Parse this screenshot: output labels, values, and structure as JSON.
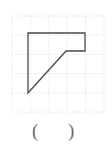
{
  "figure": {
    "title": "",
    "grid": {
      "columns": 5,
      "rows": 5,
      "cell_size": 18.4,
      "origin_x": 12,
      "origin_y": 16,
      "line_color": "#dcdcdc",
      "style": "dotted"
    },
    "shape": {
      "name": "right-trapezoid-polygon",
      "stroke_color": "#4a4a4a",
      "stroke_width": 1.3,
      "fill": "none",
      "vertices": [
        {
          "label": "A",
          "x": 28,
          "y": 33
        },
        {
          "label": "B",
          "x": 85,
          "y": 33
        },
        {
          "label": "C",
          "x": 85,
          "y": 51
        },
        {
          "label": "D",
          "x": 66,
          "y": 51
        },
        {
          "label": "E",
          "x": 28,
          "y": 93
        }
      ],
      "path": "M 28 33 L 85 33 L 85 51 L 66 51 L 28 93 Z"
    }
  },
  "answer": {
    "open_paren": "(",
    "close_paren": ")",
    "value": ""
  }
}
